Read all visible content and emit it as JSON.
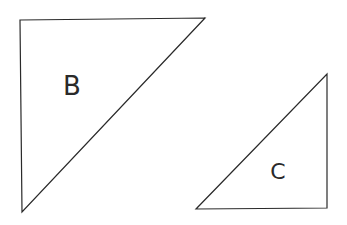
{
  "diagram": {
    "background": "#ffffff",
    "stroke_color": "#2a2a2a",
    "shapes": [
      {
        "id": "B",
        "type": "right-triangle",
        "label": "B",
        "points": "20,20 205,18 22,212",
        "label_x": 72,
        "label_y": 95,
        "label_size": 26
      },
      {
        "id": "C",
        "type": "right-triangle",
        "label": "C",
        "points": "327,74 327,208 196,209",
        "label_x": 278,
        "label_y": 179,
        "label_size": 22
      }
    ]
  }
}
